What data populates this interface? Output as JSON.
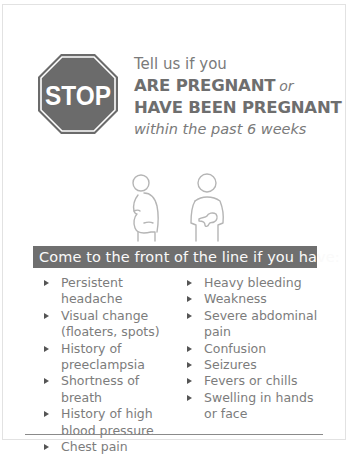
{
  "sign": {
    "label": "STOP",
    "icon": "stop-sign-icon",
    "color": "#6b6b6b"
  },
  "headline": {
    "line1": "Tell us if you",
    "line2": "ARE PREGNANT",
    "line2_suffix": "or",
    "line3": "HAVE BEEN PREGNANT",
    "line4": "within the past 6 weeks"
  },
  "illustrations": [
    {
      "icon": "pregnant-person-icon"
    },
    {
      "icon": "person-holding-baby-icon"
    }
  ],
  "banner": {
    "text": "Come to the front of the line if you have:",
    "background": "#6f6f6f"
  },
  "symptoms": {
    "left": [
      {
        "label": "Persistent headache"
      },
      {
        "label": "Visual change (floaters, spots)"
      },
      {
        "label": "History of preeclampsia"
      },
      {
        "label": "Shortness of breath"
      },
      {
        "label": "History of high blood pressure"
      },
      {
        "label": "Chest pain"
      }
    ],
    "right": [
      {
        "label": "Heavy bleeding"
      },
      {
        "label": "Weakness"
      },
      {
        "label": "Severe abdominal pain"
      },
      {
        "label": "Confusion"
      },
      {
        "label": "Seizures"
      },
      {
        "label": "Fevers or chills"
      },
      {
        "label": "Swelling in hands or face"
      }
    ]
  }
}
